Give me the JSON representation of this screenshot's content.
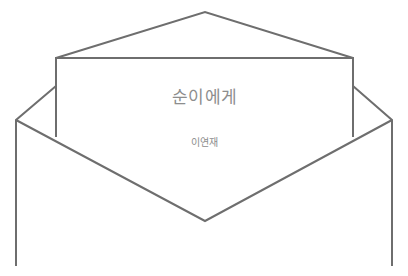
{
  "artwork": {
    "name": "open-envelope-with-letter",
    "subject": "line drawing of an opened envelope with a letter card inside",
    "background_color": "#ffffff",
    "stroke_color": "#6e6e6e",
    "stroke_width": 2,
    "width": 408,
    "height": 276
  },
  "letter": {
    "title": "순이에게",
    "author": "이연재",
    "text_color": "#8d8d8d",
    "card_fill": "#ffffff"
  },
  "shapes": {
    "back_flap_icon": "triangle-flap-icon",
    "letter_card_icon": "letter-card-icon",
    "front_flap_icon": "v-flap-icon",
    "left_wall_icon": "envelope-left-wall-icon",
    "right_wall_icon": "envelope-right-wall-icon"
  }
}
